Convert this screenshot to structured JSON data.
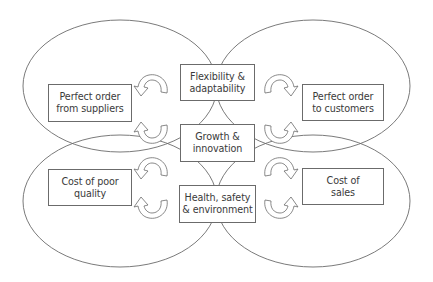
{
  "diagram": {
    "type": "overlapping-ellipses-with-central-boxes",
    "colors": {
      "stroke": "#6b6b6b",
      "text": "#3a3a3a",
      "background": "#ffffff"
    },
    "quadrants": [
      {
        "id": "top-left",
        "label": "Perfect order\nfrom suppliers"
      },
      {
        "id": "top-right",
        "label": "Perfect order\nto customers"
      },
      {
        "id": "bottom-left",
        "label": "Cost of poor\nquality"
      },
      {
        "id": "bottom-right",
        "label": "Cost of sales"
      }
    ],
    "central": [
      {
        "id": "flexibility",
        "label": "Flexibility &\nadaptability"
      },
      {
        "id": "growth",
        "label": "Growth &\ninnovation"
      },
      {
        "id": "health",
        "label": "Health, safety\n& environment"
      }
    ],
    "boxes": {
      "perfect_order_suppliers": "Perfect order\nfrom suppliers",
      "perfect_order_customers": "Perfect order\nto customers",
      "cost_poor_quality": "Cost of poor\nquality",
      "cost_of_sales": "Cost of\nsales",
      "flexibility": "Flexibility &\nadaptability",
      "growth": "Growth &\ninnovation",
      "health": "Health, safety\n& environment"
    },
    "arrows": {
      "count": 8,
      "style": "curved-hollow-arrow",
      "icon": "curved-arrow-icon"
    }
  }
}
